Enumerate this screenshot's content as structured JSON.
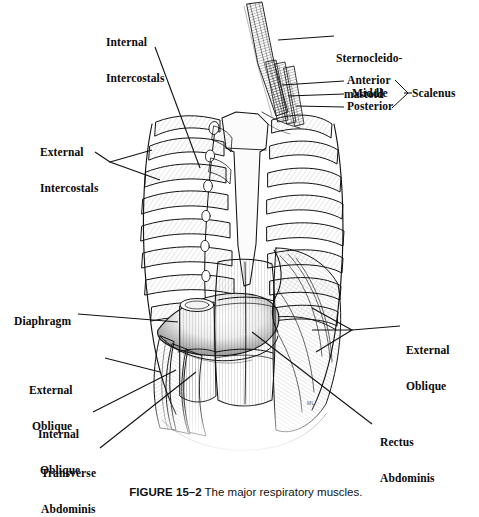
{
  "figure": {
    "caption_label": "FIGURE 15–2",
    "caption_text": "The major respiratory muscles.",
    "signature": "ML",
    "background_color": "#ffffff",
    "ink_color": "#111111"
  },
  "labels": {
    "internal_intercostals": {
      "line1": "Internal",
      "line2": "Intercostals"
    },
    "sternocleidomastoid": {
      "line1": "Sternocleido-",
      "line2": "mastoid"
    },
    "scalenus_anterior": {
      "text": "Anterior"
    },
    "scalenus_middle": {
      "text": "Middle"
    },
    "scalenus_posterior": {
      "text": "Posterior"
    },
    "scalenus_group": {
      "text": "Scalenus"
    },
    "external_intercostals": {
      "line1": "External",
      "line2": "Intercostals"
    },
    "diaphragm": {
      "text": "Diaphragm"
    },
    "external_oblique_left": {
      "line1": "External",
      "line2": "Oblique"
    },
    "external_oblique_right": {
      "line1": "External",
      "line2": "Oblique"
    },
    "internal_oblique": {
      "line1": "Internal",
      "line2": "Oblique"
    },
    "transverse_abdominis": {
      "line1": "Transverse",
      "line2": "Abdominis"
    },
    "rectus_abdominis": {
      "line1": "Rectus",
      "line2": "Abdominis"
    }
  }
}
